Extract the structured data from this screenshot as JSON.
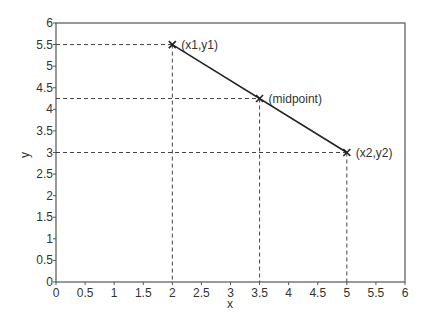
{
  "chart_data": {
    "type": "line",
    "title": "",
    "xlabel": "x",
    "ylabel": "y",
    "xlim": [
      0,
      6
    ],
    "ylim": [
      0,
      6
    ],
    "grid": false,
    "x_ticks": [
      "0",
      "0.5",
      "1",
      "1.5",
      "2",
      "2.5",
      "3",
      "3.5",
      "4",
      "4.5",
      "5",
      "5.5",
      "6"
    ],
    "y_ticks": [
      "0",
      "0.5",
      "1",
      "1.5",
      "2",
      "2.5",
      "3",
      "3.5",
      "4",
      "4.5",
      "5",
      "5.5",
      "6"
    ],
    "series": [
      {
        "name": "segment",
        "x": [
          2,
          5
        ],
        "y": [
          5.5,
          3
        ],
        "color": "#222222"
      }
    ],
    "points": [
      {
        "label": "(x1,y1)",
        "x": 2,
        "y": 5.5
      },
      {
        "label": "(midpoint)",
        "x": 3.5,
        "y": 4.25
      },
      {
        "label": "(x2,y2)",
        "x": 5,
        "y": 3
      }
    ],
    "annotations": [
      "dashed projection lines from each point to both axes"
    ]
  }
}
